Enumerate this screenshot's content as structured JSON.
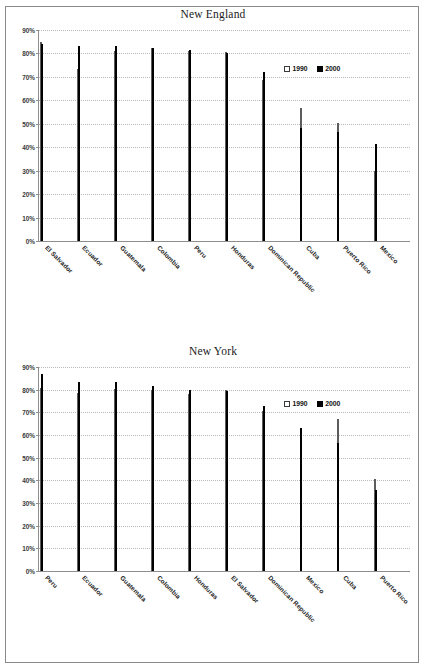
{
  "document": {
    "background": "#ffffff",
    "border_color": "#8a8a8a"
  },
  "legend": {
    "series1_label": "1990",
    "series2_label": "2000",
    "series1_color": "#ffffff",
    "series2_color": "#000000"
  },
  "axis": {
    "ticks": [
      "0%",
      "10%",
      "20%",
      "30%",
      "40%",
      "50%",
      "60%",
      "70%",
      "80%",
      "90%"
    ]
  },
  "charts": [
    {
      "title": "New England",
      "name": "new-england-chart"
    },
    {
      "title": "New York",
      "name": "new-york-chart"
    }
  ],
  "chart_data": [
    {
      "type": "bar",
      "title": "New England",
      "xlabel": "",
      "ylabel": "",
      "ylim": [
        0,
        90
      ],
      "ytick_labels": [
        "0%",
        "10%",
        "20%",
        "30%",
        "40%",
        "50%",
        "60%",
        "70%",
        "80%",
        "90%"
      ],
      "grid": true,
      "legend_position": "top-right",
      "categories": [
        "El Salvador",
        "Ecuador",
        "Guatemala",
        "Colombia",
        "Peru",
        "Honduras",
        "Dominican Republic",
        "Cuba",
        "Puerto Rico",
        "Mexico"
      ],
      "series": [
        {
          "name": "1990",
          "values": [
            85.0,
            73.5,
            81.0,
            82.5,
            81.2,
            80.8,
            68.5,
            56.7,
            50.3,
            29.8
          ]
        },
        {
          "name": "2000",
          "values": [
            84.2,
            83.3,
            83.0,
            82.4,
            81.5,
            80.2,
            72.0,
            48.0,
            46.3,
            41.5
          ]
        }
      ]
    },
    {
      "type": "bar",
      "title": "New York",
      "xlabel": "",
      "ylabel": "",
      "ylim": [
        0,
        90
      ],
      "ytick_labels": [
        "0%",
        "10%",
        "20%",
        "30%",
        "40%",
        "50%",
        "60%",
        "70%",
        "80%",
        "90%"
      ],
      "grid": true,
      "legend_position": "top-right",
      "categories": [
        "Peru",
        "Ecuador",
        "Guatemala",
        "Colombia",
        "Honduras",
        "El Salvador",
        "Dominican Republic",
        "Mexico",
        "Cuba",
        "Puerto Rico"
      ],
      "series": [
        {
          "name": "1990",
          "values": [
            80.8,
            78.6,
            80.2,
            80.0,
            78.0,
            80.0,
            70.6,
            56.4,
            67.0,
            40.6
          ]
        },
        {
          "name": "2000",
          "values": [
            86.8,
            83.6,
            83.4,
            81.6,
            80.0,
            79.4,
            73.0,
            63.2,
            56.4,
            35.8
          ]
        }
      ]
    }
  ]
}
